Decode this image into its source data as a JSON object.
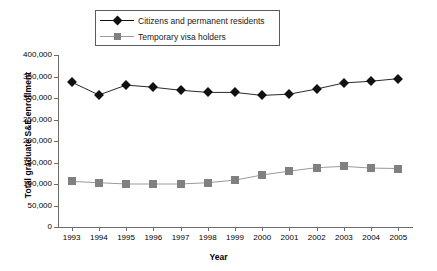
{
  "chart_data": {
    "type": "line",
    "title": "",
    "xlabel": "Year",
    "ylabel": "Total graduate S&E enrollment",
    "categories": [
      "1993",
      "1994",
      "1995",
      "1996",
      "1997",
      "1998",
      "1999",
      "2000",
      "2001",
      "2002",
      "2003",
      "2004",
      "2005"
    ],
    "ylim": [
      0,
      400000
    ],
    "ytick_values": [
      0,
      50000,
      100000,
      150000,
      200000,
      250000,
      300000,
      350000,
      400000
    ],
    "ytick_labels": [
      "0",
      "50,000",
      "100,000",
      "150,000",
      "200,000",
      "250,000",
      "300,000",
      "350,000",
      "400,000"
    ],
    "grid": false,
    "legend_position": "top-center",
    "series": [
      {
        "name": "Citizens and permanent residents",
        "marker": "diamond",
        "color": "#111111",
        "values": [
          337000,
          307000,
          330000,
          325000,
          318000,
          313000,
          313000,
          306000,
          309000,
          321000,
          335000,
          339000,
          345000
        ]
      },
      {
        "name": "Temporary visa holders",
        "marker": "square",
        "color": "#808080",
        "values": [
          106000,
          103000,
          100000,
          100000,
          100000,
          103000,
          109000,
          121000,
          130000,
          138000,
          141000,
          137000,
          136000
        ]
      }
    ]
  },
  "legend": {
    "items": [
      {
        "label": "Citizens and permanent residents",
        "marker": "diamond-marker-icon"
      },
      {
        "label": "Temporary visa holders",
        "marker": "square-marker-icon"
      }
    ]
  },
  "axes": {
    "y_axis_title": "Total graduate S&E enrollment",
    "x_axis_title": "Year"
  }
}
